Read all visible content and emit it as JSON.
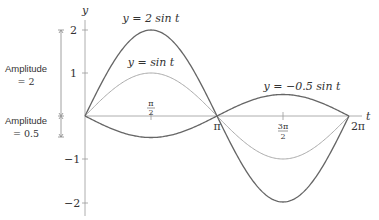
{
  "chart_data": {
    "type": "line",
    "title": "",
    "xlabel": "t",
    "ylabel": "y",
    "xlim": [
      0,
      6.2832
    ],
    "ylim": [
      -2,
      2
    ],
    "grid": false,
    "x_ticks": [
      "π/2",
      "π",
      "3π/2",
      "2π"
    ],
    "y_ticks": [
      "2",
      "1",
      "−1",
      "−2"
    ],
    "series": [
      {
        "name": "y = 2 sin t",
        "amplitude": 2,
        "color": "#666666",
        "x": [
          0,
          0.7854,
          1.5708,
          2.3562,
          3.1416,
          3.927,
          4.7124,
          5.4978,
          6.2832
        ],
        "values": [
          0,
          1.414,
          2,
          1.414,
          0,
          -1.414,
          -2,
          -1.414,
          0
        ]
      },
      {
        "name": "y = sin t",
        "amplitude": 1,
        "color": "#aaaaaa",
        "x": [
          0,
          0.7854,
          1.5708,
          2.3562,
          3.1416,
          3.927,
          4.7124,
          5.4978,
          6.2832
        ],
        "values": [
          0,
          0.707,
          1,
          0.707,
          0,
          -0.707,
          -1,
          -0.707,
          0
        ]
      },
      {
        "name": "y = −0.5 sin t",
        "amplitude": -0.5,
        "color": "#666666",
        "x": [
          0,
          0.7854,
          1.5708,
          2.3562,
          3.1416,
          3.927,
          4.7124,
          5.4978,
          6.2832
        ],
        "values": [
          0,
          -0.354,
          -0.5,
          -0.354,
          0,
          0.354,
          0.5,
          0.354,
          0
        ]
      }
    ],
    "annotations": [
      {
        "text": "Amplitude = 2",
        "span": [
          0,
          2
        ]
      },
      {
        "text": "Amplitude = 0.5",
        "span": [
          -0.5,
          0
        ]
      }
    ]
  },
  "labels": {
    "y_axis": "y",
    "x_axis": "t",
    "curve_2sin": "y = 2 sin t",
    "curve_sin": "y = sin t",
    "curve_neg05sin": "y = −0.5 sin t",
    "tick_pi_half_num": "π",
    "tick_pi_half_den": "2",
    "tick_pi": "π",
    "tick_3pi_half_num": "3π",
    "tick_3pi_half_den": "2",
    "tick_2pi": "2π",
    "y_tick_2": "2",
    "y_tick_1": "1",
    "y_tick_m1": "−1",
    "y_tick_m2": "−2",
    "amp2_line1": "Amplitude",
    "amp2_line2": "= 2",
    "amp05_line1": "Amplitude",
    "amp05_line2": "= 0.5"
  }
}
